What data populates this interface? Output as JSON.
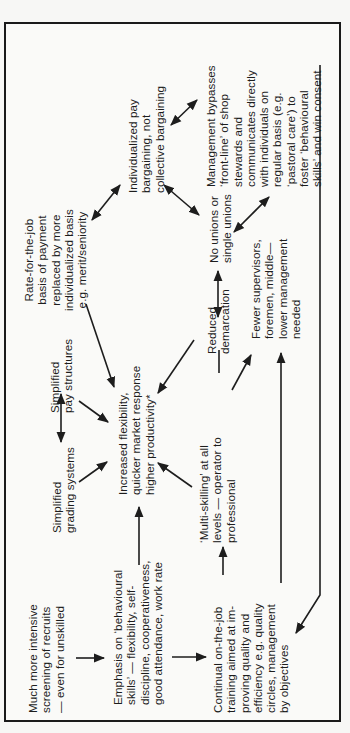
{
  "diagram": {
    "orientation": "rotated 90 degrees counter-clockwise",
    "nodes": [
      {
        "id": "screening",
        "text": "Much more intensive\nscreening of recruits\n— even for unskilled"
      },
      {
        "id": "behavioural",
        "text": "Emphasis on ‘behavioural\nskills’ — flexibility, self-\ndiscipline, cooperativeness,\ngood attendance, work rate"
      },
      {
        "id": "training",
        "text": "Continual on-the-job\ntraining aimed at im-\nproving quality and\nefficiency e.g. quality\ncircles, management\nby objectives"
      },
      {
        "id": "grading",
        "text": "Simplified\ngrading systems"
      },
      {
        "id": "pay_structures",
        "text": "Simplified\npay structures"
      },
      {
        "id": "flexibility",
        "text": "Increased flexibility,\nquicker market response\nhigher productivity*"
      },
      {
        "id": "multiskilling",
        "text": "‘Multi-skilling’ at all\nlevels — operator to\nprofessional"
      },
      {
        "id": "demarcation",
        "text": "Reduced\ndemarcation"
      },
      {
        "id": "supervisors",
        "text": "Fewer supervisors,\nforemen, middle—\nlower management\nneeded"
      },
      {
        "id": "rate_for_job",
        "text": "Rate-for-the-job\nbasis of payment\nreplaced by more\nindividualized basis\ne.g. merit/seniority"
      },
      {
        "id": "individual_pay",
        "text": "Individualized pay\nbargaining, not\ncollective bargaining"
      },
      {
        "id": "unions",
        "text": "No unions or\nsingle unions"
      },
      {
        "id": "management",
        "text": "Management bypasses\n‘front-line’ of shop\nstewards and\ncommunicates directly\nwith individuals on\nregular basis (e.g.\n‘pastoral care’) to\nfoster ‘behavioural\nskills’ and win consent"
      }
    ],
    "edges": [
      {
        "from": "screening",
        "to": "behavioural",
        "type": "arrow"
      },
      {
        "from": "behavioural",
        "to": "training",
        "type": "arrow"
      },
      {
        "from": "behavioural",
        "to": "flexibility",
        "type": "arrow"
      },
      {
        "from": "training",
        "to": "multiskilling",
        "type": "arrow"
      },
      {
        "from": "training",
        "to": "supervisors",
        "type": "arrow"
      },
      {
        "from": "management",
        "to": "training",
        "type": "arrow"
      },
      {
        "from": "grading",
        "to": "flexibility",
        "type": "arrow"
      },
      {
        "from": "grading",
        "to": "pay_structures",
        "type": "double-arrow"
      },
      {
        "from": "pay_structures",
        "to": "flexibility",
        "type": "arrow"
      },
      {
        "from": "multiskilling",
        "to": "flexibility",
        "type": "arrow"
      },
      {
        "from": "multiskilling",
        "to": "demarcation",
        "type": "line"
      },
      {
        "from": "multiskilling",
        "to": "supervisors",
        "type": "arrow"
      },
      {
        "from": "demarcation",
        "to": "flexibility",
        "type": "arrow"
      },
      {
        "from": "demarcation",
        "to": "unions",
        "type": "double-arrow"
      },
      {
        "from": "rate_for_job",
        "to": "flexibility",
        "type": "arrow"
      },
      {
        "from": "rate_for_job",
        "to": "individual_pay",
        "type": "double-arrow"
      },
      {
        "from": "individual_pay",
        "to": "unions",
        "type": "double-arrow"
      },
      {
        "from": "individual_pay",
        "to": "management",
        "type": "double-arrow"
      },
      {
        "from": "unions",
        "to": "management",
        "type": "double-arrow"
      }
    ]
  },
  "colors": {
    "ink": "#1d1d1d",
    "paper": "#fafaf8"
  }
}
